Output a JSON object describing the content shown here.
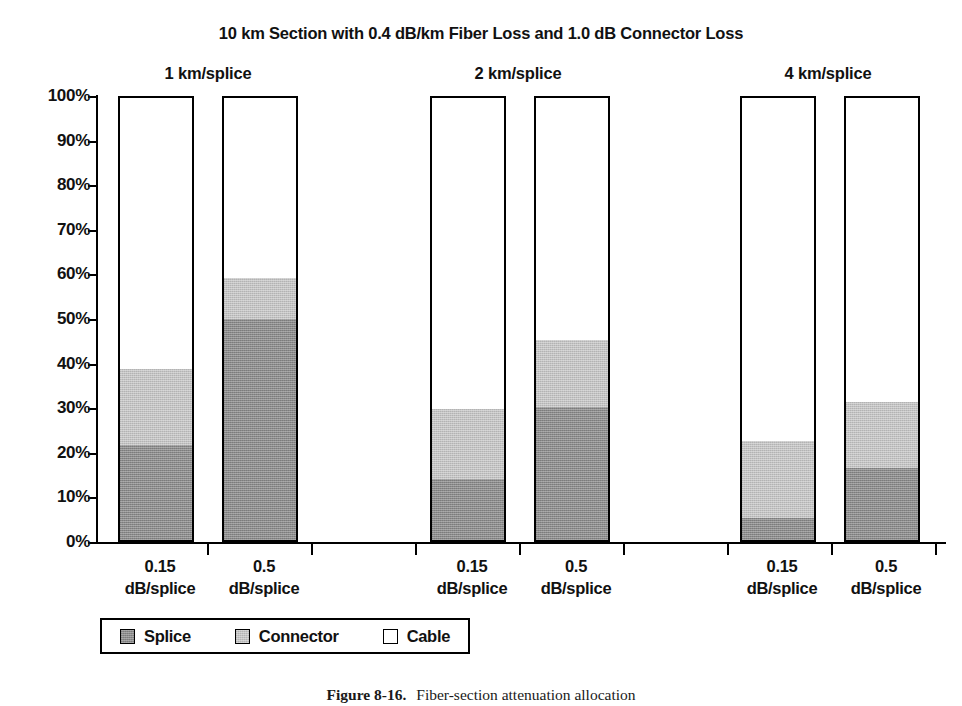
{
  "chart_data": {
    "type": "bar",
    "subtype": "stacked-percent-grouped",
    "title": "10 km Section with 0.4 dB/km Fiber Loss and 1.0 dB Connector Loss",
    "xlabel": "",
    "ylabel": "",
    "ylim": [
      0,
      100
    ],
    "ytick_labels": [
      "100%",
      "90%",
      "80%",
      "70%",
      "60%",
      "50%",
      "40%",
      "30%",
      "20%",
      "10%",
      "0%"
    ],
    "ytick_values": [
      100,
      90,
      80,
      70,
      60,
      50,
      40,
      30,
      20,
      10,
      0
    ],
    "grid": false,
    "legend_position": "bottom-left",
    "legend": [
      {
        "name": "Splice",
        "color": "#8a8a8a"
      },
      {
        "name": "Connector",
        "color": "#c2c2c2"
      },
      {
        "name": "Cable",
        "color": "#ffffff"
      }
    ],
    "series": [
      {
        "name": "Splice",
        "values": [
          21.6,
          50.0,
          13.7,
          30.2,
          5.0,
          16.2
        ]
      },
      {
        "name": "Connector",
        "values": [
          17.0,
          9.3,
          16.0,
          15.1,
          17.3,
          15.1
        ]
      },
      {
        "name": "Cable",
        "values": [
          61.4,
          40.7,
          70.3,
          54.7,
          77.7,
          68.7
        ]
      }
    ],
    "categories": [
      "0.15 dB/splice",
      "0.5 dB/splice",
      "0.15 dB/splice",
      "0.5 dB/splice",
      "0.15 dB/splice",
      "0.5 dB/splice"
    ],
    "groups": [
      {
        "label": "1 km/splice",
        "bars": [
          {
            "category_line1": "0.15",
            "category_line2": "dB/splice",
            "splice": 21.6,
            "connector": 17.0,
            "cable": 61.4
          },
          {
            "category_line1": "0.5",
            "category_line2": "dB/splice",
            "splice": 50.0,
            "connector": 9.3,
            "cable": 40.7
          }
        ]
      },
      {
        "label": "2 km/splice",
        "bars": [
          {
            "category_line1": "0.15",
            "category_line2": "dB/splice",
            "splice": 13.7,
            "connector": 16.0,
            "cable": 70.3
          },
          {
            "category_line1": "0.5",
            "category_line2": "dB/splice",
            "splice": 30.2,
            "connector": 15.1,
            "cable": 54.7
          }
        ]
      },
      {
        "label": "4 km/splice",
        "bars": [
          {
            "category_line1": "0.15",
            "category_line2": "dB/splice",
            "splice": 5.0,
            "connector": 17.3,
            "cable": 77.7
          },
          {
            "category_line1": "0.5",
            "category_line2": "dB/splice",
            "splice": 16.2,
            "connector": 15.1,
            "cable": 68.7
          }
        ]
      }
    ]
  },
  "groups": [
    {
      "label": "1 km/splice"
    },
    {
      "label": "2 km/splice"
    },
    {
      "label": "4 km/splice"
    }
  ],
  "bars": [
    {
      "line1": "0.15",
      "line2": "dB/splice"
    },
    {
      "line1": "0.5",
      "line2": "dB/splice"
    },
    {
      "line1": "0.15",
      "line2": "dB/splice"
    },
    {
      "line1": "0.5",
      "line2": "dB/splice"
    },
    {
      "line1": "0.15",
      "line2": "dB/splice"
    },
    {
      "line1": "0.5",
      "line2": "dB/splice"
    }
  ],
  "yticks": [
    "100%",
    "90%",
    "80%",
    "70%",
    "60%",
    "50%",
    "40%",
    "30%",
    "20%",
    "10%",
    "0%"
  ],
  "legend": {
    "items": [
      {
        "label": "Splice",
        "swatch": "splice"
      },
      {
        "label": "Connector",
        "swatch": "connector"
      },
      {
        "label": "Cable",
        "swatch": "cable"
      }
    ]
  },
  "caption": {
    "label": "Figure 8-16.",
    "text": "Fiber-section attenuation allocation"
  },
  "colors": {
    "splice": "#8a8a8a",
    "connector": "#c2c2c2",
    "cable": "#ffffff",
    "outline": "#000000"
  }
}
